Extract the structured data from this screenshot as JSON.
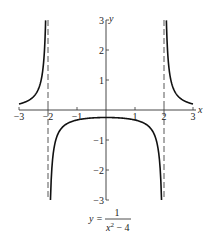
{
  "chart_data": {
    "type": "line",
    "title": "",
    "function": "y = 1/(x^2 - 4)",
    "caption": {
      "lhs": "y =",
      "numerator": "1",
      "denominator_base": "x",
      "denominator_exp": "2",
      "denominator_rest": " − 4"
    },
    "xlabel": "x",
    "ylabel": "y",
    "xlim": [
      -3,
      3
    ],
    "ylim": [
      -3,
      3
    ],
    "x_ticks": [
      -3,
      -2,
      -1,
      1,
      2,
      3
    ],
    "x_tick_labels": [
      "−3",
      "−2",
      "−1",
      "1",
      "2",
      "3"
    ],
    "y_ticks": [
      -3,
      -2,
      -1,
      1,
      2,
      3
    ],
    "y_tick_labels": [
      "−3",
      "−2",
      "−1",
      "1",
      "2",
      "3"
    ],
    "vertical_asymptotes": [
      -2,
      2
    ],
    "horizontal_asymptote": 0,
    "grid": false,
    "series": [
      {
        "name": "left branch",
        "x": [
          -3,
          -2.8,
          -2.6,
          -2.4,
          -2.2,
          -2.1,
          -2.082
        ],
        "y": [
          0.2,
          0.26,
          0.36,
          0.57,
          1.19,
          2.44,
          3.0
        ]
      },
      {
        "name": "center branch",
        "x": [
          -1.915,
          -1.9,
          -1.8,
          -1.5,
          -1,
          0,
          1,
          1.5,
          1.8,
          1.9,
          1.915
        ],
        "y": [
          -3.0,
          -2.56,
          -1.32,
          -0.57,
          -0.33,
          -0.25,
          -0.33,
          -0.57,
          -1.32,
          -2.56,
          -3.0
        ]
      },
      {
        "name": "right branch",
        "x": [
          2.082,
          2.1,
          2.2,
          2.4,
          2.6,
          2.8,
          3
        ],
        "y": [
          3.0,
          2.44,
          1.19,
          0.57,
          0.36,
          0.26,
          0.2
        ]
      }
    ],
    "colors": {
      "curve": "#111111",
      "axis": "#333333",
      "asymptote": "#444444"
    }
  }
}
